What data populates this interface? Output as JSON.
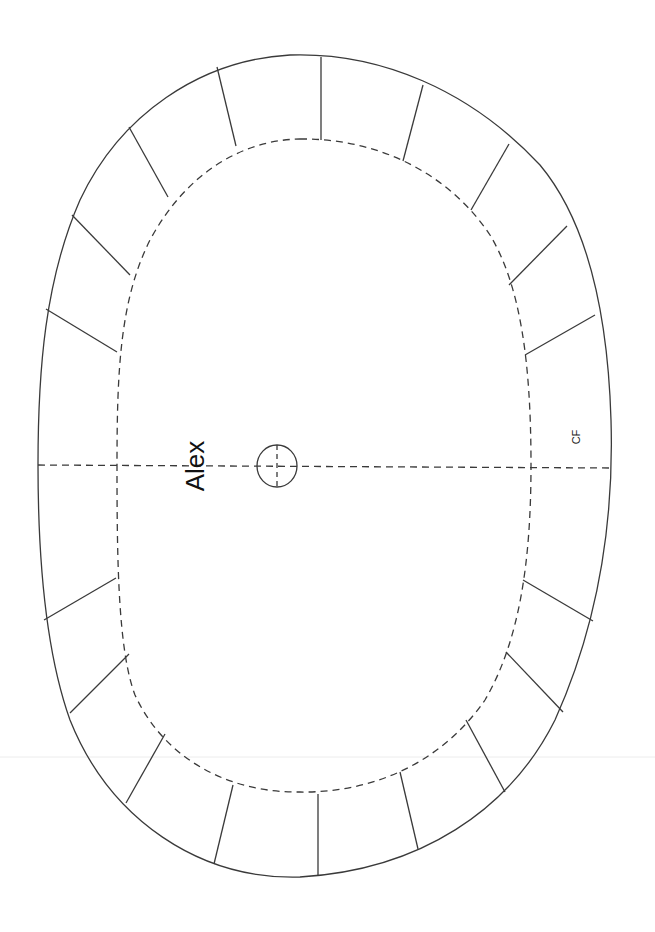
{
  "diagram": {
    "type": "pattern-template",
    "labels": {
      "name": "Alex",
      "center_front": "CF"
    },
    "colors": {
      "stroke": "#3a3a3a",
      "background": "#ffffff"
    },
    "elements": [
      "outer-cut-line",
      "inner-dashed-seam-line",
      "center-dashed-axis",
      "center-circle-marker",
      "radial-segment-lines"
    ],
    "radial_segments": [
      {
        "x1": 321,
        "y1": 57,
        "x2": 321,
        "y2": 140
      },
      {
        "x1": 217,
        "y1": 67,
        "x2": 236,
        "y2": 146
      },
      {
        "x1": 129,
        "y1": 127,
        "x2": 168,
        "y2": 197
      },
      {
        "x1": 72,
        "y1": 215,
        "x2": 130,
        "y2": 275
      },
      {
        "x1": 46,
        "y1": 309,
        "x2": 117,
        "y2": 352
      },
      {
        "x1": 423,
        "y1": 85,
        "x2": 403,
        "y2": 161
      },
      {
        "x1": 509,
        "y1": 144,
        "x2": 471,
        "y2": 210
      },
      {
        "x1": 567,
        "y1": 226,
        "x2": 509,
        "y2": 285
      },
      {
        "x1": 595,
        "y1": 315,
        "x2": 525,
        "y2": 355
      },
      {
        "x1": 44,
        "y1": 620,
        "x2": 116,
        "y2": 578
      },
      {
        "x1": 70,
        "y1": 713,
        "x2": 129,
        "y2": 654
      },
      {
        "x1": 126,
        "y1": 803,
        "x2": 165,
        "y2": 734
      },
      {
        "x1": 214,
        "y1": 864,
        "x2": 233,
        "y2": 785
      },
      {
        "x1": 318,
        "y1": 876,
        "x2": 318,
        "y2": 794
      },
      {
        "x1": 418,
        "y1": 849,
        "x2": 400,
        "y2": 772
      },
      {
        "x1": 505,
        "y1": 792,
        "x2": 466,
        "y2": 720
      },
      {
        "x1": 563,
        "y1": 712,
        "x2": 506,
        "y2": 652
      },
      {
        "x1": 593,
        "y1": 621,
        "x2": 523,
        "y2": 580
      }
    ]
  }
}
